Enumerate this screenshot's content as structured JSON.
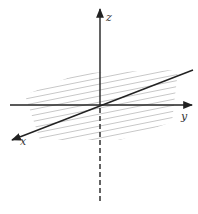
{
  "diagram": {
    "type": "3d-coordinate-axes",
    "origin": [
      100,
      105
    ],
    "colors": {
      "axis": "#222222",
      "hatch": "#c8c8c8",
      "label": "#333333",
      "background": "#ffffff"
    },
    "axes": {
      "x": {
        "label": "x",
        "label_pos": [
          22,
          143
        ],
        "start": [
          193,
          70
        ],
        "end": [
          11,
          140
        ],
        "arrow": true
      },
      "y": {
        "label": "y",
        "label_pos": [
          181,
          119
        ],
        "start": [
          10,
          105
        ],
        "end": [
          193,
          105
        ],
        "arrow": true
      },
      "z": {
        "label": "z",
        "label_pos": [
          106,
          21
        ],
        "start": [
          100,
          105
        ],
        "end": [
          100,
          8
        ],
        "arrow": true
      },
      "z_negative": {
        "start": [
          100,
          107
        ],
        "end": [
          100,
          203
        ],
        "dashed": true
      }
    },
    "plane": {
      "description": "hatched xy-plane",
      "line_count": 17
    }
  }
}
